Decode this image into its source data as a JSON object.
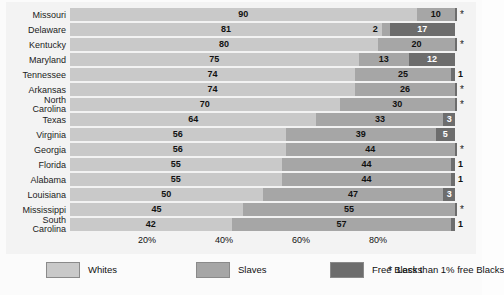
{
  "chart_data": {
    "type": "bar",
    "subtype": "stacked-horizontal-100pct",
    "title": "",
    "xlabel": "",
    "ylabel": "",
    "xlim": [
      0,
      100
    ],
    "grid": false,
    "legend_position": "bottom",
    "categories": [
      "Missouri",
      "Delaware",
      "Kentucky",
      "Maryland",
      "Tennessee",
      "Arkansas",
      "North\nCarolina",
      "Texas",
      "Virginia",
      "Georgia",
      "Florida",
      "Alabama",
      "Louisiana",
      "Mississippi",
      "South\nCarolina"
    ],
    "series": [
      {
        "name": "Whites",
        "color": "#c9c9c9",
        "values": [
          90,
          81,
          80,
          75,
          74,
          74,
          70,
          64,
          56,
          56,
          55,
          55,
          50,
          45,
          42
        ]
      },
      {
        "name": "Slaves",
        "color": "#a6a6a6",
        "values": [
          10,
          2,
          20,
          13,
          25,
          26,
          30,
          33,
          39,
          44,
          44,
          44,
          47,
          55,
          57
        ]
      },
      {
        "name": "Free Blacks",
        "color": "#6d6d6d",
        "values": [
          0.5,
          17,
          0.5,
          12,
          1,
          0.5,
          0.5,
          3,
          5,
          0.5,
          1,
          1,
          3,
          0.5,
          1
        ]
      }
    ],
    "xticks": [
      20,
      40,
      60,
      80
    ],
    "xticklabels": [
      "20%",
      "40%",
      "60%",
      "80%"
    ],
    "rows": [
      {
        "state": "Missouri",
        "whites": 90,
        "slaves": 10,
        "free": 0.5,
        "whites_label": "90",
        "slaves_label": "10",
        "free_label": "",
        "free_marker": "star"
      },
      {
        "state": "Delaware",
        "whites": 81,
        "slaves": 2,
        "free": 17,
        "whites_label": "81",
        "slaves_label": "2",
        "free_label": "17",
        "free_marker": "none"
      },
      {
        "state": "Kentucky",
        "whites": 80,
        "slaves": 20,
        "free": 0.5,
        "whites_label": "80",
        "slaves_label": "20",
        "free_label": "",
        "free_marker": "star"
      },
      {
        "state": "Maryland",
        "whites": 75,
        "slaves": 13,
        "free": 12,
        "whites_label": "75",
        "slaves_label": "13",
        "free_label": "12",
        "free_marker": "none"
      },
      {
        "state": "Tennessee",
        "whites": 74,
        "slaves": 25,
        "free": 1,
        "whites_label": "74",
        "slaves_label": "25",
        "free_label": "1",
        "free_marker": "outside"
      },
      {
        "state": "Arkansas",
        "whites": 74,
        "slaves": 26,
        "free": 0.5,
        "whites_label": "74",
        "slaves_label": "26",
        "free_label": "",
        "free_marker": "star"
      },
      {
        "state": "North Carolina",
        "whites": 70,
        "slaves": 30,
        "free": 0.5,
        "whites_label": "70",
        "slaves_label": "30",
        "free_label": "",
        "free_marker": "star"
      },
      {
        "state": "Texas",
        "whites": 64,
        "slaves": 33,
        "free": 3,
        "whites_label": "64",
        "slaves_label": "33",
        "free_label": "3",
        "free_marker": "inside"
      },
      {
        "state": "Virginia",
        "whites": 56,
        "slaves": 39,
        "free": 5,
        "whites_label": "56",
        "slaves_label": "39",
        "free_label": "5",
        "free_marker": "inside"
      },
      {
        "state": "Georgia",
        "whites": 56,
        "slaves": 44,
        "free": 0.5,
        "whites_label": "56",
        "slaves_label": "44",
        "free_label": "",
        "free_marker": "star"
      },
      {
        "state": "Florida",
        "whites": 55,
        "slaves": 44,
        "free": 1,
        "whites_label": "55",
        "slaves_label": "44",
        "free_label": "1",
        "free_marker": "outside"
      },
      {
        "state": "Alabama",
        "whites": 55,
        "slaves": 44,
        "free": 1,
        "whites_label": "55",
        "slaves_label": "44",
        "free_label": "1",
        "free_marker": "outside"
      },
      {
        "state": "Louisiana",
        "whites": 50,
        "slaves": 47,
        "free": 3,
        "whites_label": "50",
        "slaves_label": "47",
        "free_label": "3",
        "free_marker": "inside"
      },
      {
        "state": "Mississippi",
        "whites": 45,
        "slaves": 55,
        "free": 0.5,
        "whites_label": "45",
        "slaves_label": "55",
        "free_label": "",
        "free_marker": "star"
      },
      {
        "state": "South Carolina",
        "whites": 42,
        "slaves": 57,
        "free": 1,
        "whites_label": "42",
        "slaves_label": "57",
        "free_label": "1",
        "free_marker": "outside"
      }
    ]
  },
  "axis": {
    "ticks": [
      "20%",
      "40%",
      "60%",
      "80%"
    ]
  },
  "legend": {
    "items": [
      {
        "label": "Whites",
        "color": "#c9c9c9"
      },
      {
        "label": "Slaves",
        "color": "#a6a6a6"
      },
      {
        "label": "Free Blacks",
        "color": "#6d6d6d"
      }
    ],
    "note_symbol": "*",
    "note": "Less than 1% free Blacks"
  },
  "colors": {
    "whites": "#c9c9c9",
    "slaves": "#a6a6a6",
    "free_blacks": "#6d6d6d",
    "panel_background": "#f3f3f3",
    "page_background": "#fbfbfb",
    "text": "#111111"
  }
}
